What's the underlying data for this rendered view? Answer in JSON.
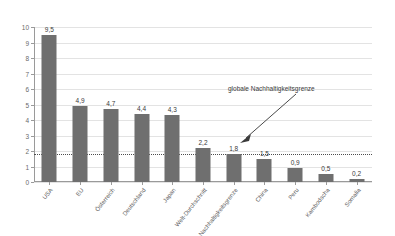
{
  "chart_data": {
    "type": "bar",
    "title": "",
    "subtitle": "",
    "xlabel": "",
    "ylabel": "",
    "ylim": [
      0,
      10
    ],
    "yticks": [
      0,
      1,
      2,
      3,
      4,
      5,
      6,
      7,
      8,
      9,
      10
    ],
    "ytick_labels": [
      "0",
      "1",
      "2",
      "3",
      "4",
      "5",
      "6",
      "7",
      "8",
      "9",
      "10"
    ],
    "grid": true,
    "legend": false,
    "decimal_separator": ",",
    "categories": [
      "USA",
      "EU",
      "Österreich",
      "Deutschland",
      "Japan",
      "Welt-Durchschnitt",
      "Nachhaltigkeitsgrenze",
      "China",
      "Peru",
      "Kambodscha",
      "Somalia"
    ],
    "values": [
      9.5,
      4.9,
      4.7,
      4.4,
      4.3,
      2.2,
      1.8,
      1.5,
      0.9,
      0.5,
      0.2
    ],
    "value_labels": [
      "9,5",
      "4,9",
      "4,7",
      "4,4",
      "4,3",
      "2,2",
      "1,8",
      "1,5",
      "0,9",
      "0,5",
      "0,2"
    ],
    "annotations": [
      {
        "text": "globale Nachhaltigkeitsgrenze",
        "points_to_value": 1.8,
        "points_to_category": "Nachhaltigkeitsgrenze",
        "style": "arrow"
      }
    ],
    "reference_lines": [
      {
        "value": 1.8,
        "style": "dotted",
        "label": "globale Nachhaltigkeitsgrenze"
      }
    ],
    "colors": {
      "bar": "#6f6f6f",
      "grid": "#e3e3e3",
      "axis": "#9a9a9a",
      "text": "#3a3a3a",
      "tick_text": "#6a6a6a",
      "reference_line": "#4d4d4d",
      "background": "#ffffff"
    }
  }
}
